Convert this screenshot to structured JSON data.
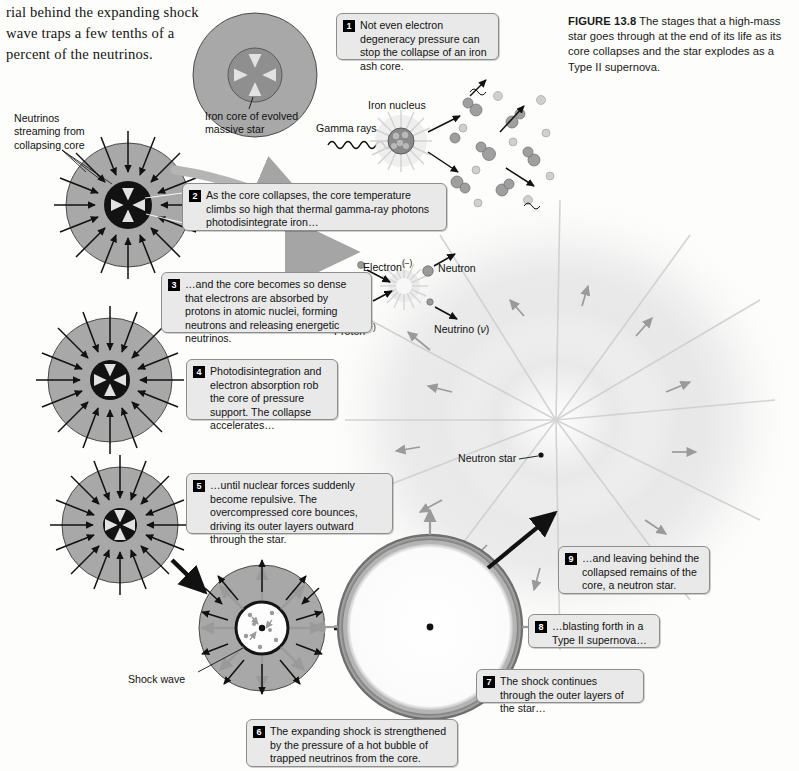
{
  "body_text": "rial behind the expanding shock wave traps a few tenths of a percent of the neutrinos.",
  "caption": {
    "label": "FIGURE 13.8",
    "text": "The stages that a high-mass star goes through at the end of its life as its core collapses and the star explodes as a Type II supernova."
  },
  "callouts": [
    {
      "num": "1",
      "text": "Not even electron degeneracy pressure can stop the collapse of an iron ash core."
    },
    {
      "num": "2",
      "text": "As the core collapses, the core temperature climbs so high that thermal gamma-ray photons photodisintegrate iron…"
    },
    {
      "num": "3",
      "text": "…and the core becomes so dense that electrons are absorbed by protons in atomic nuclei, forming neutrons and releasing energetic neutrinos."
    },
    {
      "num": "4",
      "text": "Photodisintegration and electron absorption rob the core of pressure support. The collapse accelerates…"
    },
    {
      "num": "5",
      "text": "…until nuclear forces suddenly become repulsive. The overcompressed core bounces, driving its outer layers outward through the star."
    },
    {
      "num": "6",
      "text": "The expanding shock is strengthened by the pressure of a hot bubble of trapped neutrinos from the core."
    },
    {
      "num": "7",
      "text": "The shock continues through the outer layers of the star…"
    },
    {
      "num": "8",
      "text": "…blasting forth in a Type II supernova…"
    },
    {
      "num": "9",
      "text": "…and leaving behind the collapsed remains of the core, a neutron star."
    }
  ],
  "labels": {
    "neutrinos_streaming": "Neutrinos\nstreaming from\ncollapsing core",
    "iron_core": "Iron core of evolved\nmassive star",
    "gamma_rays": "Gamma rays",
    "iron_nucleus": "Iron nucleus",
    "electron": "Electron",
    "electron_charge": "(−)",
    "proton": "Proton",
    "proton_charge": "(+)",
    "neutron": "Neutron",
    "neutrino": "Neutrino (",
    "neutrino_symbol": "ν",
    "neutrino_close": ")",
    "neutron_star": "Neutron star",
    "shock_wave": "Shock wave"
  },
  "colors": {
    "star_body": "#a8a8a8",
    "core_dark": "#1a1a1a",
    "box_fill": "#e9e9e9",
    "box_border": "#8d8d8d",
    "arrow": "#111111",
    "burst_glow": "#d9d9d9"
  }
}
